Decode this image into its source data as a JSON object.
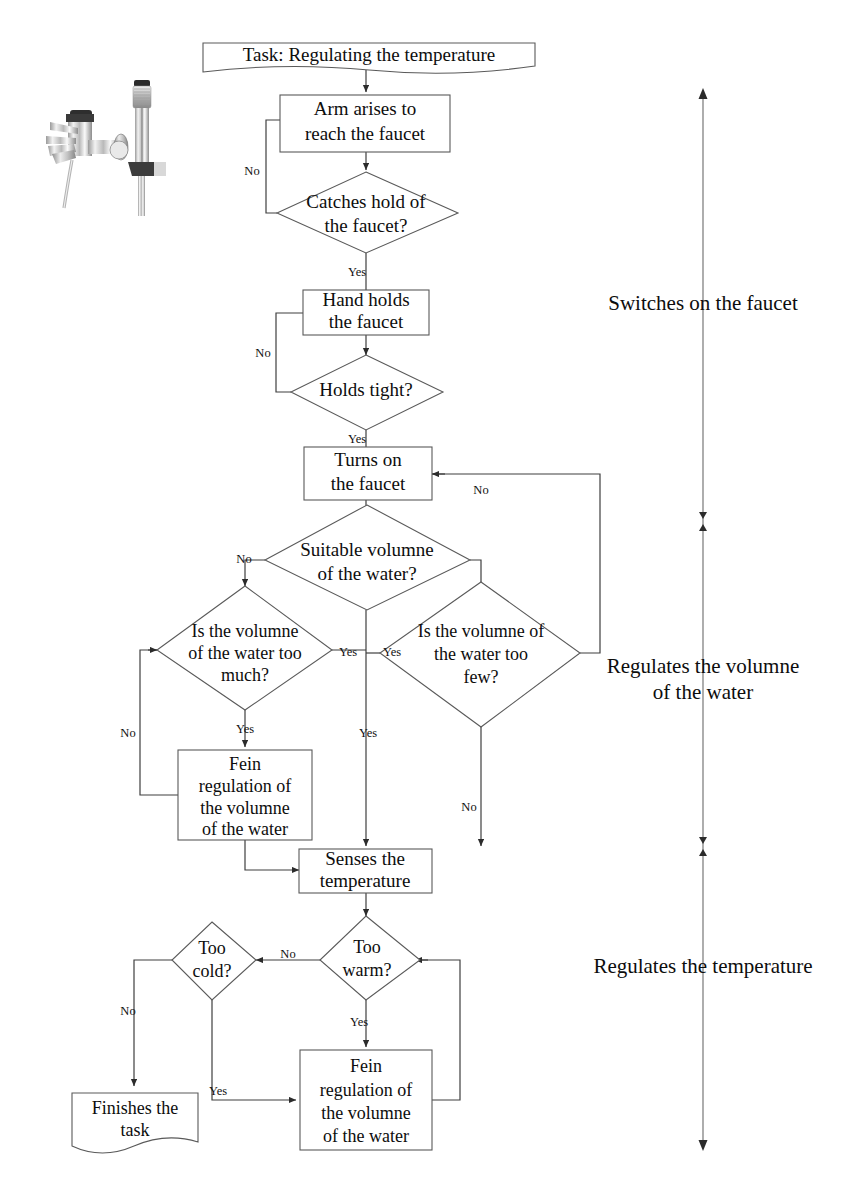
{
  "diagram": {
    "title_shape": {
      "label": "Task: Regulating the temperature",
      "shape": "document"
    },
    "photo": {
      "name": "faucet-photograph",
      "alt": "Bathtub faucet with handheld shower head"
    },
    "nodes": {
      "arm_arises": {
        "line1": "Arm arises to",
        "line2": "reach the faucet",
        "shape": "process"
      },
      "catches_hold": {
        "line1": "Catches hold of",
        "line2": "the faucet?",
        "shape": "decision"
      },
      "hand_holds": {
        "line1": "Hand holds",
        "line2": "the faucet",
        "shape": "process"
      },
      "holds_tight": {
        "line1": "Holds tight?",
        "line2": "",
        "shape": "decision"
      },
      "turns_on": {
        "line1": "Turns on",
        "line2": "the faucet",
        "shape": "process"
      },
      "suitable_volume": {
        "line1": "Suitable volumne",
        "line2": "of the water?",
        "shape": "decision"
      },
      "too_much": {
        "line1": "Is the volumne",
        "line2": "of the water too",
        "line3": "much?",
        "shape": "decision"
      },
      "too_few": {
        "line1": "Is the volumne of",
        "line2": "the water too",
        "line3": "few?",
        "shape": "decision"
      },
      "fein_volume": {
        "line1": "Fein",
        "line2": "regulation of",
        "line3": "the volumne",
        "line4": "of the water",
        "shape": "process"
      },
      "senses_temp": {
        "line1": "Senses the",
        "line2": "temperature",
        "shape": "process"
      },
      "too_cold": {
        "line1": "Too",
        "line2": "cold?",
        "shape": "decision"
      },
      "too_warm": {
        "line1": "Too",
        "line2": "warm?",
        "shape": "decision"
      },
      "fein_temp": {
        "line1": "Fein",
        "line2": "regulation of",
        "line3": "the volumne",
        "line4": "of the water",
        "shape": "process"
      },
      "finishes": {
        "line1": "Finishes the",
        "line2": "task",
        "shape": "document"
      }
    },
    "edge_labels": {
      "catches_no": "No",
      "catches_yes": "Yes",
      "holds_no": "No",
      "holds_yes": "Yes",
      "suitable_no": "No",
      "suitable_yes": "Yes",
      "too_much_no": "No",
      "too_much_yes": "Yes",
      "too_few_no": "No",
      "too_few_yes": "Yes",
      "turns_on_no": "No",
      "too_warm_no": "No",
      "too_warm_yes": "Yes",
      "too_cold_no": "No",
      "too_cold_yes": "Yes"
    },
    "phases": [
      {
        "id": "phase-switches-on",
        "label": "Switches on the faucet"
      },
      {
        "id": "phase-regulates-volume",
        "line1": "Regulates the volumne",
        "line2": "of the water"
      },
      {
        "id": "phase-regulates-temperature",
        "label": "Regulates the temperature"
      }
    ],
    "colors": {
      "shape_stroke": "#5a5a5a",
      "connector_stroke": "#3f3f3f",
      "axis_stroke": "#6b6b6b",
      "text": "#0d0d0d",
      "background": "#ffffff"
    }
  }
}
